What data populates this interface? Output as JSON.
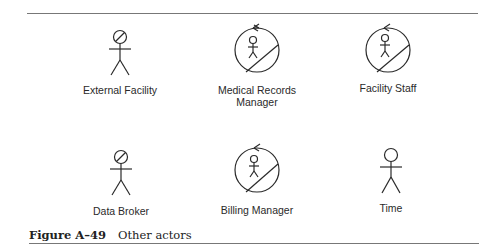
{
  "figure": {
    "number_label": "Figure A–49",
    "title": "Other actors"
  },
  "actors": [
    {
      "label": "External Facility",
      "icon": "stick-figure-with-slashed-head-icon",
      "row": 1,
      "col": 1
    },
    {
      "label_line1": "Medical Records",
      "label_line2": "Manager",
      "icon": "worker-actor-circle-icon",
      "row": 1,
      "col": 2
    },
    {
      "label": "Facility Staff",
      "icon": "worker-actor-circle-icon",
      "row": 1,
      "col": 3
    },
    {
      "label": "Data Broker",
      "icon": "stick-figure-with-slashed-head-icon",
      "row": 2,
      "col": 1
    },
    {
      "label": "Billing Manager",
      "icon": "worker-actor-circle-icon",
      "row": 2,
      "col": 2
    },
    {
      "label": "Time",
      "icon": "stick-figure-icon",
      "row": 2,
      "col": 3
    }
  ],
  "colors": {
    "stroke": "#2a2a2a",
    "rule": "#777777",
    "background": "#ffffff"
  }
}
